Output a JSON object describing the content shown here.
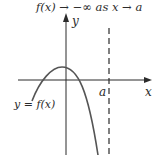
{
  "title": "f(x) → −∞ as x → a",
  "axes": {
    "x_label": "x",
    "y_label": "y"
  },
  "curve_label": "y = f(x)",
  "asymptote_label": "a",
  "colors": {
    "ink": "#2b2b2b",
    "background": "#ffffff"
  }
}
